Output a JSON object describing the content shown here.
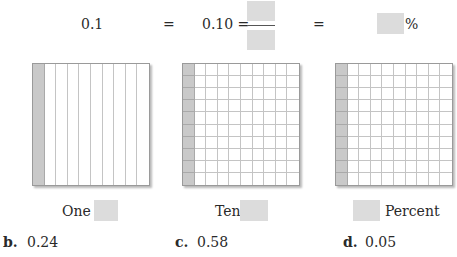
{
  "equation": {
    "decimal": "0.1",
    "equals1": "=",
    "hundredths_expr": "0.10 =",
    "equals2": "=",
    "percent_sign": "%",
    "blanks": {
      "numerator": "",
      "denominator": "",
      "percent": ""
    }
  },
  "models": [
    {
      "name": "ones-model",
      "rows": 1,
      "cols": 10,
      "shaded_cols": 1,
      "label_prefix": "One",
      "label_suffix": "",
      "blank_position": "after"
    },
    {
      "name": "tenths-model",
      "rows": 10,
      "cols": 10,
      "shaded_cols": 1,
      "label_prefix": "Ten",
      "label_suffix": "",
      "blank_position": "after"
    },
    {
      "name": "percent-model",
      "rows": 10,
      "cols": 10,
      "shaded_cols": 1,
      "label_prefix": "",
      "label_suffix": "Percent",
      "blank_position": "before"
    }
  ],
  "problems": [
    {
      "letter": "b.",
      "value": "0.24"
    },
    {
      "letter": "c.",
      "value": "0.58"
    },
    {
      "letter": "d.",
      "value": "0.05"
    }
  ],
  "colors": {
    "blank_fill": "#dcdcdc",
    "shaded_cell": "#c9c9c9",
    "grid_line": "#c4c4c4"
  }
}
